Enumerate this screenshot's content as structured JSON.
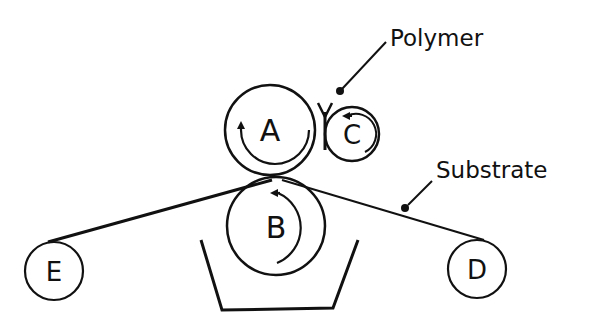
{
  "diagram": {
    "rolls": [
      {
        "id": "A",
        "label": "A",
        "rotation": "clockwise"
      },
      {
        "id": "B",
        "label": "B",
        "rotation": "counterclockwise"
      },
      {
        "id": "C",
        "label": "C",
        "rotation": "counterclockwise"
      },
      {
        "id": "D",
        "label": "D"
      },
      {
        "id": "E",
        "label": "E"
      }
    ],
    "annotations": {
      "polymer": "Polymer",
      "substrate": "Substrate"
    },
    "elements": {
      "trough": "trough",
      "web": "substrate web"
    },
    "colors": {
      "ink": "#111111",
      "background": "#ffffff"
    }
  }
}
